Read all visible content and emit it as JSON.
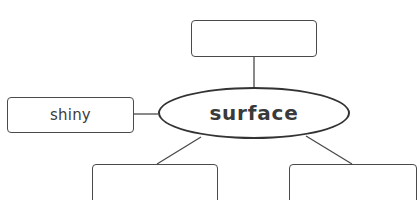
{
  "diagram": {
    "type": "concept-web",
    "center": {
      "label": "surface"
    },
    "nodes": [
      {
        "position": "top",
        "label": ""
      },
      {
        "position": "left",
        "label": "shiny"
      },
      {
        "position": "bottom-left",
        "label": ""
      },
      {
        "position": "bottom-right",
        "label": ""
      }
    ],
    "colors": {
      "stroke": "#4a4a4a",
      "ellipse_stroke": "#333333",
      "center_text": "#3a3a3a",
      "node_text": "#3c3c3c",
      "background": "#ffffff"
    }
  }
}
